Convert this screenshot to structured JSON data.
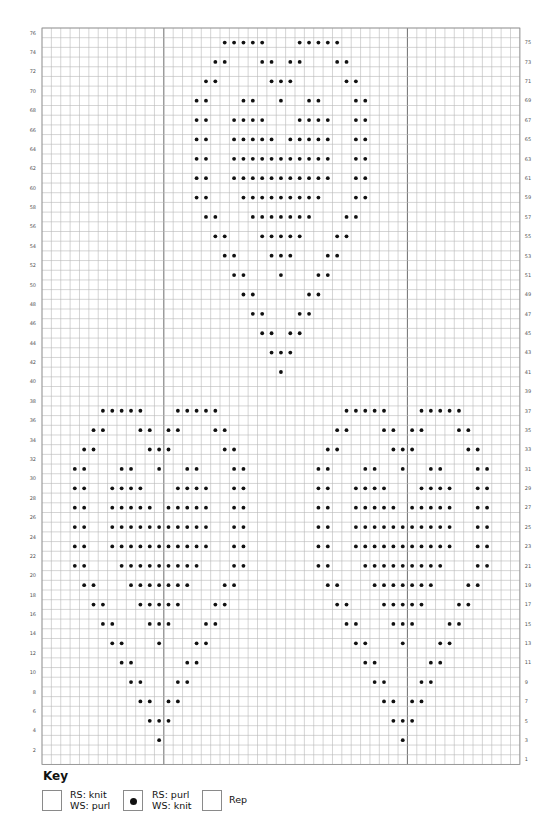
{
  "chart_data": {
    "type": "table",
    "stitch_columns": 51,
    "rows": 76,
    "rep": {
      "start_col": 13,
      "end_col": 38,
      "stitches": 26
    },
    "left_row_labels": [
      2,
      4,
      6,
      8,
      10,
      12,
      14,
      16,
      18,
      20,
      22,
      24,
      26,
      28,
      30,
      32,
      34,
      36,
      38,
      40,
      42,
      44,
      46,
      48,
      50,
      52,
      54,
      56,
      58,
      60,
      62,
      64,
      66,
      68,
      70,
      72,
      74,
      76
    ],
    "right_row_labels": [
      1,
      3,
      5,
      7,
      9,
      11,
      13,
      15,
      17,
      19,
      21,
      23,
      25,
      27,
      29,
      31,
      33,
      35,
      37,
      39,
      41,
      43,
      45,
      47,
      49,
      51,
      53,
      55,
      57,
      59,
      61,
      63,
      65,
      67,
      69,
      71,
      73,
      75
    ],
    "purl_stitches": {
      "note": "0-based column index from left edge of chart; all other cells are knit (RS)",
      "3": [
        12,
        38
      ],
      "5": [
        11,
        12,
        13,
        37,
        38,
        39
      ],
      "7": [
        10,
        11,
        13,
        14,
        36,
        37,
        39,
        40
      ],
      "9": [
        9,
        10,
        14,
        15,
        35,
        36,
        40,
        41
      ],
      "11": [
        8,
        9,
        15,
        16,
        34,
        35,
        41,
        42
      ],
      "13": [
        7,
        8,
        12,
        16,
        17,
        33,
        34,
        38,
        42,
        43
      ],
      "15": [
        6,
        7,
        11,
        12,
        13,
        17,
        18,
        32,
        33,
        37,
        38,
        39,
        43,
        44
      ],
      "17": [
        5,
        6,
        10,
        11,
        12,
        13,
        14,
        18,
        19,
        31,
        32,
        36,
        37,
        38,
        39,
        40,
        44,
        45
      ],
      "19": [
        4,
        5,
        9,
        10,
        11,
        12,
        13,
        14,
        15,
        19,
        20,
        30,
        31,
        35,
        36,
        37,
        38,
        39,
        40,
        41,
        45,
        46
      ],
      "21": [
        3,
        4,
        8,
        9,
        10,
        11,
        12,
        13,
        14,
        15,
        16,
        20,
        21,
        29,
        30,
        34,
        35,
        36,
        37,
        38,
        39,
        40,
        41,
        42,
        46,
        47
      ],
      "23": [
        3,
        4,
        7,
        8,
        9,
        10,
        11,
        12,
        13,
        14,
        15,
        16,
        17,
        20,
        21,
        29,
        30,
        33,
        34,
        35,
        36,
        37,
        38,
        39,
        40,
        41,
        42,
        43,
        46,
        47
      ],
      "25": [
        3,
        4,
        7,
        8,
        9,
        10,
        11,
        12,
        13,
        14,
        15,
        16,
        17,
        20,
        21,
        29,
        30,
        33,
        34,
        35,
        36,
        37,
        38,
        39,
        40,
        41,
        42,
        43,
        46,
        47
      ],
      "27": [
        3,
        4,
        7,
        8,
        9,
        10,
        11,
        13,
        14,
        15,
        16,
        17,
        20,
        21,
        29,
        30,
        33,
        34,
        35,
        36,
        37,
        39,
        40,
        41,
        42,
        43,
        46,
        47
      ],
      "29": [
        3,
        4,
        7,
        8,
        9,
        10,
        14,
        15,
        16,
        17,
        20,
        21,
        29,
        30,
        33,
        34,
        35,
        36,
        40,
        41,
        42,
        43,
        46,
        47
      ],
      "31": [
        3,
        4,
        8,
        9,
        12,
        15,
        16,
        20,
        21,
        29,
        30,
        34,
        35,
        38,
        41,
        42,
        46,
        47
      ],
      "33": [
        4,
        5,
        11,
        12,
        13,
        19,
        20,
        30,
        31,
        37,
        38,
        39,
        45,
        46
      ],
      "35": [
        5,
        6,
        10,
        11,
        13,
        14,
        18,
        19,
        31,
        32,
        36,
        37,
        39,
        40,
        44,
        45
      ],
      "37": [
        6,
        7,
        8,
        9,
        10,
        14,
        15,
        16,
        17,
        18,
        32,
        33,
        34,
        35,
        36,
        40,
        41,
        42,
        43,
        44
      ],
      "41": [
        25
      ],
      "43": [
        24,
        25,
        26
      ],
      "45": [
        23,
        24,
        26,
        27
      ],
      "47": [
        22,
        23,
        27,
        28
      ],
      "49": [
        21,
        22,
        28,
        29
      ],
      "51": [
        20,
        21,
        25,
        29,
        30
      ],
      "53": [
        19,
        20,
        24,
        25,
        26,
        30,
        31
      ],
      "55": [
        18,
        19,
        23,
        24,
        25,
        26,
        27,
        31,
        32
      ],
      "57": [
        17,
        18,
        22,
        23,
        24,
        25,
        26,
        27,
        28,
        32,
        33
      ],
      "59": [
        16,
        17,
        21,
        22,
        23,
        24,
        25,
        26,
        27,
        28,
        29,
        33,
        34
      ],
      "61": [
        16,
        17,
        20,
        21,
        22,
        23,
        24,
        25,
        26,
        27,
        28,
        29,
        30,
        33,
        34
      ],
      "63": [
        16,
        17,
        20,
        21,
        22,
        23,
        24,
        25,
        26,
        27,
        28,
        29,
        30,
        33,
        34
      ],
      "65": [
        16,
        17,
        20,
        21,
        22,
        23,
        24,
        26,
        27,
        28,
        29,
        30,
        33,
        34
      ],
      "67": [
        16,
        17,
        20,
        21,
        22,
        23,
        27,
        28,
        29,
        30,
        33,
        34
      ],
      "69": [
        16,
        17,
        21,
        22,
        25,
        28,
        29,
        33,
        34
      ],
      "71": [
        17,
        18,
        24,
        25,
        26,
        32,
        33
      ],
      "73": [
        18,
        19,
        23,
        24,
        26,
        27,
        31,
        32
      ],
      "75": [
        19,
        20,
        21,
        22,
        23,
        27,
        28,
        29,
        30,
        31
      ]
    }
  },
  "key": {
    "title": "Key",
    "items": [
      {
        "symbol": "blank-square",
        "line1": "RS: knit",
        "line2": "WS: purl"
      },
      {
        "symbol": "dot-square",
        "line1": "RS: purl",
        "line2": "WS: knit"
      },
      {
        "symbol": "rep-outline",
        "line1": "Rep",
        "line2": ""
      }
    ]
  }
}
